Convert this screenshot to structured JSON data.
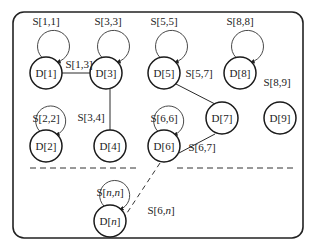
{
  "diagram": {
    "nodes": [
      {
        "id": "D1",
        "label": "D[1]",
        "self_loop": "S[1,1]",
        "loop_style": "above"
      },
      {
        "id": "D3",
        "label": "D[3]",
        "self_loop": "S[3,3]",
        "loop_style": "above"
      },
      {
        "id": "D5",
        "label": "D[5]",
        "self_loop": "S[5,5]",
        "loop_style": "above"
      },
      {
        "id": "D8",
        "label": "D[8]",
        "self_loop": "S[8,8]",
        "loop_style": "above"
      },
      {
        "id": "D2",
        "label": "D[2]",
        "self_loop": "S[2,2]",
        "loop_style": "inside"
      },
      {
        "id": "D4",
        "label": "D[4]",
        "self_loop": null
      },
      {
        "id": "D6",
        "label": "D[6]",
        "self_loop": "S[6,6]",
        "loop_style": "inside"
      },
      {
        "id": "D7",
        "label": "D[7]",
        "self_loop": null
      },
      {
        "id": "D9",
        "label": "D[9]",
        "self_loop": null
      },
      {
        "id": "Dn",
        "label": "D[n]",
        "label_prefix": "D[",
        "label_var": "n",
        "label_suffix": "]",
        "self_loop": "S[n,n]",
        "loop_style": "inside"
      }
    ],
    "edges": [
      {
        "from": "D1",
        "to": "D3",
        "label": "S[1,3]",
        "style": "solid"
      },
      {
        "from": "D3",
        "to": "D4",
        "label": "S[3,4]",
        "style": "solid"
      },
      {
        "from": "D5",
        "to": "D7",
        "label": "S[5,7]",
        "style": "solid"
      },
      {
        "from": "D6",
        "to": "D7",
        "label": "S[6,7]",
        "style": "solid"
      },
      {
        "from": "D8",
        "to": "D9",
        "label": "S[8,9]",
        "style": "label-only"
      },
      {
        "from": "D6",
        "to": "Dn",
        "label": "S[6,n]",
        "style": "dashed"
      }
    ],
    "labels": {
      "s11": "S[1,1]",
      "s33": "S[3,3]",
      "s55": "S[5,5]",
      "s88": "S[8,8]",
      "s22": "S[2,2]",
      "s66": "S[6,6]",
      "snn_prefix": "S[",
      "snn_var": "n,n",
      "snn_suffix": "]",
      "s13": "S[1,3]",
      "s34": "S[3,4]",
      "s57": "S[5,7]",
      "s89": "S[8,9]",
      "s67": "S[6,7]",
      "s6n_prefix": "S[6,",
      "s6n_var": "n",
      "s6n_suffix": "]",
      "d1": "D[1]",
      "d2": "D[2]",
      "d3": "D[3]",
      "d4": "D[4]",
      "d5": "D[5]",
      "d6": "D[6]",
      "d7": "D[7]",
      "d8": "D[8]",
      "d9": "D[9]",
      "dn_prefix": "D[",
      "dn_var": "n",
      "dn_suffix": "]"
    }
  }
}
